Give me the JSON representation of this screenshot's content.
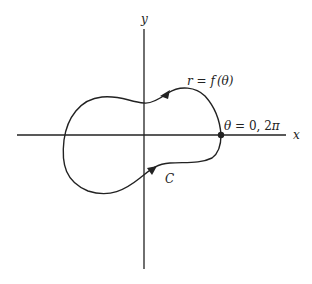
{
  "diagram": {
    "type": "polar-curve",
    "axes": {
      "x_label": "x",
      "y_label": "y"
    },
    "curve": {
      "equation_label_r": "r",
      "equation_label_eq": " = ",
      "equation_label_f": "f",
      "equation_label_arg": "(θ)",
      "name": "C",
      "orientation": "counterclockwise"
    },
    "start_point": {
      "label_theta": "θ",
      "label_rest": " = 0, 2",
      "label_pi": "π"
    },
    "colors": {
      "stroke": "#222222",
      "background": "#ffffff"
    }
  }
}
